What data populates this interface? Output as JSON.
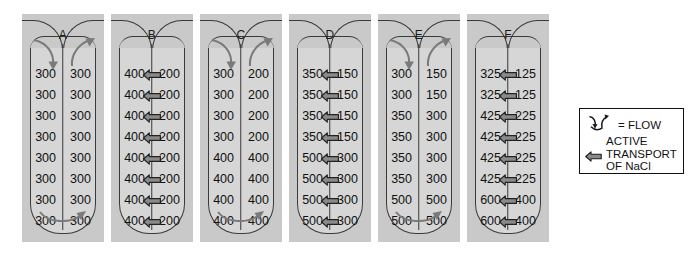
{
  "diagram": {
    "title_letters": [
      "A",
      "B",
      "C",
      "D",
      "E",
      "F"
    ],
    "colors": {
      "panel_background": "#c9c9c9",
      "tube_background": "#d6d6d6",
      "outline": "#3a3a3a",
      "text": "#111111",
      "arrow_fill": "#7a7a7a",
      "nacl_arrow_fill": "#8a8a8a",
      "legend_border": "#111111"
    },
    "panels": [
      {
        "letter": "A",
        "has_flow_arrows": true,
        "has_nacl_arrows": false,
        "rows": [
          {
            "left": "300",
            "right": "300"
          },
          {
            "left": "300",
            "right": "300"
          },
          {
            "left": "300",
            "right": "300"
          },
          {
            "left": "300",
            "right": "300"
          },
          {
            "left": "300",
            "right": "300"
          },
          {
            "left": "300",
            "right": "300"
          },
          {
            "left": "300",
            "right": "300"
          },
          {
            "left": "300",
            "right": "300"
          }
        ]
      },
      {
        "letter": "B",
        "has_flow_arrows": false,
        "has_nacl_arrows": true,
        "rows": [
          {
            "left": "400",
            "right": "200"
          },
          {
            "left": "400",
            "right": "200"
          },
          {
            "left": "400",
            "right": "200"
          },
          {
            "left": "400",
            "right": "200"
          },
          {
            "left": "400",
            "right": "200"
          },
          {
            "left": "400",
            "right": "200"
          },
          {
            "left": "400",
            "right": "200"
          },
          {
            "left": "400",
            "right": "200"
          }
        ]
      },
      {
        "letter": "C",
        "has_flow_arrows": true,
        "has_nacl_arrows": false,
        "rows": [
          {
            "left": "300",
            "right": "200"
          },
          {
            "left": "300",
            "right": "200"
          },
          {
            "left": "300",
            "right": "200"
          },
          {
            "left": "300",
            "right": "200"
          },
          {
            "left": "400",
            "right": "400"
          },
          {
            "left": "400",
            "right": "400"
          },
          {
            "left": "400",
            "right": "400"
          },
          {
            "left": "400",
            "right": "400"
          }
        ]
      },
      {
        "letter": "D",
        "has_flow_arrows": false,
        "has_nacl_arrows": true,
        "rows": [
          {
            "left": "350",
            "right": "150"
          },
          {
            "left": "350",
            "right": "150"
          },
          {
            "left": "350",
            "right": "150"
          },
          {
            "left": "350",
            "right": "150"
          },
          {
            "left": "500",
            "right": "300"
          },
          {
            "left": "500",
            "right": "300"
          },
          {
            "left": "500",
            "right": "300"
          },
          {
            "left": "500",
            "right": "300"
          }
        ]
      },
      {
        "letter": "E",
        "has_flow_arrows": true,
        "has_nacl_arrows": false,
        "rows": [
          {
            "left": "300",
            "right": "150"
          },
          {
            "left": "300",
            "right": "150"
          },
          {
            "left": "350",
            "right": "300"
          },
          {
            "left": "350",
            "right": "300"
          },
          {
            "left": "350",
            "right": "300"
          },
          {
            "left": "350",
            "right": "300"
          },
          {
            "left": "500",
            "right": "500"
          },
          {
            "left": "500",
            "right": "500"
          }
        ]
      },
      {
        "letter": "F",
        "has_flow_arrows": false,
        "has_nacl_arrows": true,
        "rows": [
          {
            "left": "325",
            "right": "125"
          },
          {
            "left": "325",
            "right": "125"
          },
          {
            "left": "425",
            "right": "225"
          },
          {
            "left": "425",
            "right": "225"
          },
          {
            "left": "425",
            "right": "225"
          },
          {
            "left": "425",
            "right": "225"
          },
          {
            "left": "600",
            "right": "400"
          },
          {
            "left": "600",
            "right": "400"
          }
        ]
      }
    ]
  },
  "legend": {
    "flow_label": "= FLOW",
    "active_transport_line1": "ACTIVE",
    "active_transport_line2": "TRANSPORT",
    "active_transport_line3": "OF NaCl",
    "flow_icon_name": "flow-arrows-icon",
    "nacl_icon_name": "nacl-transport-arrow-icon"
  }
}
